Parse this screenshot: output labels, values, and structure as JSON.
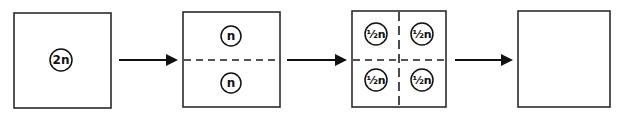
{
  "diagram": {
    "type": "cell-division-ploidy-sequence",
    "stages": [
      {
        "id": "stage-1",
        "box": {
          "x": 14,
          "y": 13,
          "w": 97,
          "h": 95
        },
        "circles": [
          {
            "cx": 61,
            "cy": 60,
            "r": 11,
            "label": "2n"
          }
        ],
        "dividers": []
      },
      {
        "id": "stage-2",
        "box": {
          "x": 183,
          "y": 12,
          "w": 97,
          "h": 95
        },
        "circles": [
          {
            "cx": 231,
            "cy": 36,
            "r": 10,
            "label": "n"
          },
          {
            "cx": 231,
            "cy": 83,
            "r": 10,
            "label": "n"
          }
        ],
        "dividers": [
          "horizontal-dashed"
        ]
      },
      {
        "id": "stage-3",
        "box": {
          "x": 352,
          "y": 11,
          "w": 94,
          "h": 96
        },
        "circles": [
          {
            "cx": 376,
            "cy": 34,
            "r": 11,
            "label": "½n"
          },
          {
            "cx": 422,
            "cy": 34,
            "r": 11,
            "label": "½n"
          },
          {
            "cx": 376,
            "cy": 80,
            "r": 11,
            "label": "½n"
          },
          {
            "cx": 422,
            "cy": 80,
            "r": 11,
            "label": "½n"
          }
        ],
        "dividers": [
          "horizontal-dashed",
          "vertical-dashed"
        ]
      },
      {
        "id": "stage-4",
        "box": {
          "x": 518,
          "y": 11,
          "w": 92,
          "h": 96
        },
        "circles": [],
        "dividers": []
      }
    ],
    "arrows": [
      {
        "from": "stage-1",
        "to": "stage-2",
        "x1": 119,
        "x2": 177,
        "y": 60
      },
      {
        "from": "stage-2",
        "to": "stage-3",
        "x1": 287,
        "x2": 346,
        "y": 60
      },
      {
        "from": "stage-3",
        "to": "stage-4",
        "x1": 455,
        "x2": 512,
        "y": 60
      }
    ],
    "labels": {
      "stage1_circle": "2n",
      "stage2_top": "n",
      "stage2_bottom": "n",
      "stage3_top_left": "½n",
      "stage3_top_right": "½n",
      "stage3_bottom_left": "½n",
      "stage3_bottom_right": "½n"
    },
    "colors": {
      "stroke": "#2b2b2b",
      "arrow": "#111111",
      "background": "#ffffff"
    }
  }
}
